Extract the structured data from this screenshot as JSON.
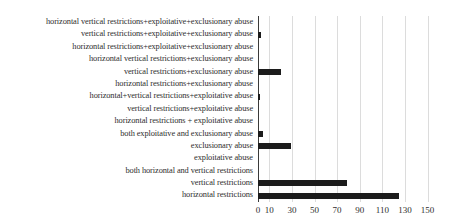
{
  "chart_data": {
    "type": "bar",
    "orientation": "horizontal",
    "title": "",
    "xlabel": "",
    "ylabel": "",
    "categories": [
      "horizontal vertical restrictions+exploitative+exclusionary abuse",
      "vertical restrictions+exploitative+exclusionary abuse",
      "horizontal restrictions+exploitative+exclusionary abuse",
      "horizontal vertical restrictions+exclusionary abuse",
      "vertical restrictions+exclusionary abuse",
      "horizontal restrictions+exclusionary abuse",
      "horizontal+vertical restrictions+exploitative abuse",
      "vertical restrictions+exploitative abuse",
      "horizontal restrictions + exploitative abuse",
      "both exploitative and exclusionary abuse",
      "exclusionary abuse",
      "exploitative abuse",
      "both horizontal and vertical restrictions",
      "vertical restrictions",
      "horizontal restrictions"
    ],
    "values": [
      0,
      3,
      0,
      0,
      20,
      0,
      2,
      0,
      0,
      4,
      29,
      0,
      0,
      79,
      125
    ],
    "xticks": [
      0,
      10,
      30,
      50,
      70,
      90,
      110,
      130,
      150
    ],
    "xtick_labels": [
      "0",
      "10",
      "30",
      "50",
      "70",
      "90",
      "110",
      "130",
      "150"
    ],
    "xlim": [
      0,
      160
    ],
    "grid": true,
    "legend": false,
    "bar_color": "#1c1c1c",
    "gridline_color": "#dcdcdc",
    "axis_color": "#3a3a3a",
    "text_color": "#2e2e2e"
  }
}
